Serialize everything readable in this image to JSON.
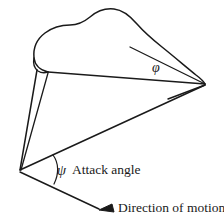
{
  "figure": {
    "kind": "line-drawing",
    "title": "",
    "background_color": "#ffffff",
    "stroke_color": "#1a1a1a"
  },
  "labels": {
    "attack_angle": "Attack angle",
    "direction_of_motion": "Direction of motion"
  },
  "symbols": {
    "phi": "φ",
    "psi": "ψ"
  },
  "annotations": {
    "angle_phi_name": "phi-angle-symbol",
    "angle_psi_name": "psi-angle-symbol",
    "arrow_name": "direction-of-motion-arrow",
    "arc_name": "attack-angle-arc"
  },
  "geometry": {
    "apex": [
      20,
      170
    ],
    "right_vertex": [
      205,
      84
    ],
    "leading_edge_start": [
      48,
      72
    ],
    "arrow_tip": [
      100,
      210
    ],
    "arrow_tail": [
      20,
      172
    ]
  }
}
